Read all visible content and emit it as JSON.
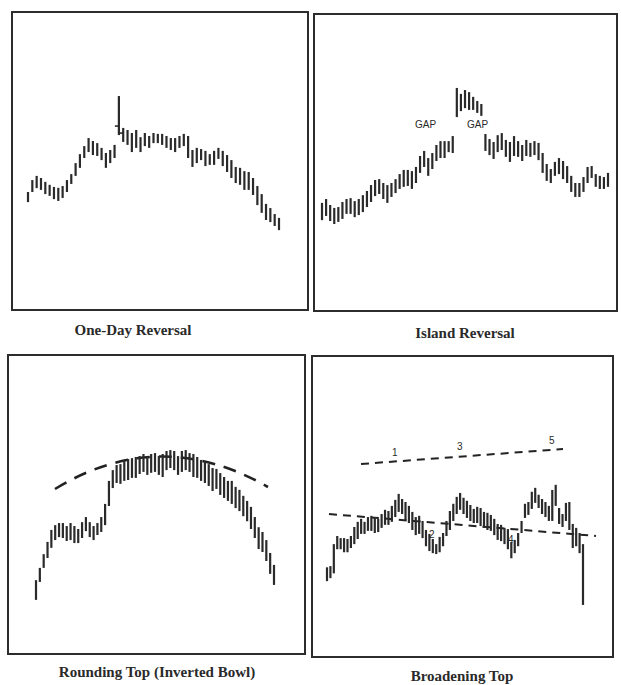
{
  "chart_data": [
    {
      "type": "bar",
      "subtype": "ohlc-range",
      "title": "One-Day Reversal",
      "xlabel": "",
      "ylabel": "",
      "ylim": [
        0,
        100
      ],
      "grid": false,
      "bars": [
        [
          39.6,
          36.2
        ],
        [
          43.6,
          39.6
        ],
        [
          45,
          40.9
        ],
        [
          44.3,
          40.3
        ],
        [
          43,
          38.9
        ],
        [
          42,
          38.3
        ],
        [
          41.3,
          37.2
        ],
        [
          41,
          36.6
        ],
        [
          41.6,
          37.6
        ],
        [
          43.6,
          39.6
        ],
        [
          45.6,
          42.3
        ],
        [
          49.3,
          45
        ],
        [
          52.3,
          47.7
        ],
        [
          55,
          51
        ],
        [
          57.7,
          53
        ],
        [
          56.7,
          52
        ],
        [
          56,
          51.7
        ],
        [
          54.4,
          50.3
        ],
        [
          52.7,
          47.7
        ],
        [
          53.7,
          49.3
        ],
        [
          55.4,
          51
        ],
        [
          71.8,
          58.7
        ],
        [
          61.1,
          56.4
        ],
        [
          60.4,
          55.4
        ],
        [
          59.4,
          53
        ],
        [
          60.4,
          54.4
        ],
        [
          58,
          53
        ],
        [
          59.4,
          55
        ],
        [
          58.4,
          54.4
        ],
        [
          59.4,
          56
        ],
        [
          59.1,
          56
        ],
        [
          59.1,
          55.4
        ],
        [
          58.4,
          54.4
        ],
        [
          57.7,
          53.7
        ],
        [
          57.7,
          53
        ],
        [
          58.4,
          54.4
        ],
        [
          59.1,
          55
        ],
        [
          58.4,
          51
        ],
        [
          53.7,
          48
        ],
        [
          54.4,
          49.3
        ],
        [
          54,
          50.3
        ],
        [
          53.4,
          48.3
        ],
        [
          52.3,
          48.7
        ],
        [
          53.4,
          48.7
        ],
        [
          54.4,
          50.7
        ],
        [
          53.4,
          48.3
        ],
        [
          52,
          46.3
        ],
        [
          50.3,
          44.3
        ],
        [
          48,
          42.6
        ],
        [
          47.7,
          42
        ],
        [
          46.6,
          40.3
        ],
        [
          46.3,
          40.3
        ],
        [
          44.3,
          38.6
        ],
        [
          41.6,
          35.2
        ],
        [
          38.9,
          32.6
        ],
        [
          35.6,
          30.2
        ],
        [
          34.2,
          29.5
        ],
        [
          32.2,
          28.2
        ],
        [
          30.9,
          26.8
        ]
      ],
      "reversal_bar_index": 21,
      "annotations": []
    },
    {
      "type": "bar",
      "subtype": "ohlc-range",
      "title": "Island Reversal",
      "xlabel": "",
      "ylabel": "",
      "ylim": [
        0,
        100
      ],
      "grid": false,
      "bars": [
        [
          36.4,
          30.6
        ],
        [
          37.7,
          32
        ],
        [
          35.7,
          30.3
        ],
        [
          34.7,
          29.3
        ],
        [
          35,
          30
        ],
        [
          36.7,
          31
        ],
        [
          37.7,
          32.7
        ],
        [
          38,
          32.7
        ],
        [
          37,
          31.6
        ],
        [
          37.7,
          32.3
        ],
        [
          39,
          33.3
        ],
        [
          40.4,
          35
        ],
        [
          42.4,
          36.7
        ],
        [
          44.1,
          38.7
        ],
        [
          44.4,
          39.4
        ],
        [
          43.1,
          37.7
        ],
        [
          42.4,
          36.4
        ],
        [
          43.1,
          38.4
        ],
        [
          44.4,
          39.7
        ],
        [
          46.1,
          41.1
        ],
        [
          47.5,
          41.8
        ],
        [
          47.5,
          42.1
        ],
        [
          47.1,
          41.1
        ],
        [
          48.5,
          43.1
        ],
        [
          52.2,
          46.5
        ],
        [
          53.9,
          48.5
        ],
        [
          51.5,
          45.5
        ],
        [
          53.2,
          47.8
        ],
        [
          55.9,
          50.5
        ],
        [
          57.2,
          51.5
        ],
        [
          57.2,
          51.5
        ],
        [
          57.2,
          53.5
        ],
        [
          58.9,
          53.2
        ],
        [
          75.1,
          65.3
        ],
        [
          73.1,
          67.3
        ],
        [
          74.4,
          68.3
        ],
        [
          73.7,
          67.7
        ],
        [
          72.1,
          67.7
        ],
        [
          70.7,
          66.7
        ],
        [
          69.7,
          65.7
        ],
        [
          59.6,
          53.9
        ],
        [
          57.9,
          52.5
        ],
        [
          56.9,
          51.2
        ],
        [
          59.2,
          53.5
        ],
        [
          59.9,
          54.2
        ],
        [
          57.6,
          51.9
        ],
        [
          56.9,
          50.2
        ],
        [
          58.9,
          52.2
        ],
        [
          57.2,
          51.9
        ],
        [
          55.9,
          50.5
        ],
        [
          57.6,
          52.2
        ],
        [
          56.6,
          51.9
        ],
        [
          57.2,
          52.5
        ],
        [
          56.6,
          50.8
        ],
        [
          53.2,
          46.5
        ],
        [
          49.5,
          43.8
        ],
        [
          47.8,
          43.1
        ],
        [
          50.2,
          45.5
        ],
        [
          51.5,
          46.1
        ],
        [
          50.5,
          44.4
        ],
        [
          48.8,
          43.1
        ],
        [
          45.5,
          40.1
        ],
        [
          43.1,
          38.4
        ],
        [
          43.1,
          38.4
        ],
        [
          45.1,
          40.1
        ],
        [
          48.5,
          43.1
        ],
        [
          48.8,
          44.8
        ],
        [
          46.1,
          41.8
        ],
        [
          45.5,
          41.1
        ],
        [
          45.1,
          41.1
        ],
        [
          46.5,
          41.8
        ]
      ],
      "gap_after_bar_indices": [
        32,
        39
      ],
      "annotations": [
        {
          "text": "GAP",
          "position": "left of island"
        },
        {
          "text": "GAP",
          "position": "right of island"
        }
      ]
    },
    {
      "type": "bar",
      "subtype": "ohlc-range",
      "title": "Rounding Top (Inverted Bowl)",
      "xlabel": "",
      "ylabel": "",
      "ylim": [
        0,
        100
      ],
      "grid": false,
      "bars": [
        [
          24.7,
          18.1
        ],
        [
          28.8,
          24.1
        ],
        [
          33.4,
          28.8
        ],
        [
          37.5,
          32.1
        ],
        [
          41.5,
          35.5
        ],
        [
          43.1,
          38.1
        ],
        [
          43.8,
          39.1
        ],
        [
          43.8,
          38.8
        ],
        [
          42.8,
          37.8
        ],
        [
          43.8,
          38.1
        ],
        [
          42.8,
          37.1
        ],
        [
          41.8,
          37.1
        ],
        [
          44.1,
          38.8
        ],
        [
          45.8,
          41.1
        ],
        [
          44.1,
          39.1
        ],
        [
          42.8,
          38.1
        ],
        [
          43.8,
          39.8
        ],
        [
          45.8,
          40.8
        ],
        [
          50.2,
          43.1
        ],
        [
          57.9,
          49.5
        ],
        [
          61.5,
          55.5
        ],
        [
          63.2,
          57.2
        ],
        [
          63.5,
          56.9
        ],
        [
          64.5,
          57.9
        ],
        [
          65.2,
          58.2
        ],
        [
          65.5,
          58.9
        ],
        [
          65.9,
          58.9
        ],
        [
          66.2,
          60.2
        ],
        [
          66.9,
          60.9
        ],
        [
          66.2,
          59.9
        ],
        [
          66.9,
          60.6
        ],
        [
          67.2,
          60.9
        ],
        [
          66.2,
          59.9
        ],
        [
          66.9,
          59.2
        ],
        [
          67.9,
          61.5
        ],
        [
          68.2,
          62.2
        ],
        [
          67.9,
          61.5
        ],
        [
          66.2,
          59.9
        ],
        [
          67.9,
          60.9
        ],
        [
          68.2,
          61.5
        ],
        [
          67.2,
          60.9
        ],
        [
          66.9,
          59.2
        ],
        [
          65.9,
          58.9
        ],
        [
          64.9,
          57.9
        ],
        [
          64.2,
          57.2
        ],
        [
          63.5,
          56.2
        ],
        [
          62.2,
          54.5
        ],
        [
          61.9,
          55.2
        ],
        [
          60.5,
          53.2
        ],
        [
          59.2,
          52.2
        ],
        [
          57.9,
          51.2
        ],
        [
          57.9,
          50.2
        ],
        [
          55.9,
          48.8
        ],
        [
          54.9,
          47.8
        ],
        [
          52.9,
          46.1
        ],
        [
          51.2,
          44.4
        ],
        [
          49.2,
          41.8
        ],
        [
          45.8,
          38.8
        ],
        [
          42.4,
          35.1
        ],
        [
          40.8,
          34.1
        ],
        [
          38.1,
          31.1
        ],
        [
          33.8,
          26.8
        ],
        [
          29.8,
          23.1
        ]
      ],
      "trendline": {
        "style": "dashed",
        "shape": "inverted arc above price"
      },
      "annotations": []
    },
    {
      "type": "bar",
      "subtype": "ohlc-range",
      "title": "Broadening Top",
      "xlabel": "",
      "ylabel": "",
      "ylim": [
        0,
        100
      ],
      "grid": false,
      "bars": [
        [
          29.8,
          25.2
        ],
        [
          30.2,
          26.2
        ],
        [
          37.5,
          27.8
        ],
        [
          40.2,
          35.8
        ],
        [
          39.5,
          35.8
        ],
        [
          39.5,
          34.8
        ],
        [
          39.2,
          34.8
        ],
        [
          40.2,
          36.2
        ],
        [
          43.2,
          37.5
        ],
        [
          44.9,
          39.2
        ],
        [
          45.9,
          40.9
        ],
        [
          44.9,
          40.9
        ],
        [
          46.5,
          41.9
        ],
        [
          46.9,
          41.9
        ],
        [
          46.5,
          41.2
        ],
        [
          45.9,
          41.5
        ],
        [
          47.5,
          42.9
        ],
        [
          48.9,
          43.9
        ],
        [
          48.5,
          43.9
        ],
        [
          50.2,
          44.9
        ],
        [
          52.2,
          46.5
        ],
        [
          54.2,
          48.2
        ],
        [
          52.5,
          47.5
        ],
        [
          51.5,
          45.5
        ],
        [
          50.2,
          44.5
        ],
        [
          48.2,
          42.2
        ],
        [
          46.5,
          40.5
        ],
        [
          46.9,
          40.9
        ],
        [
          45.2,
          39.5
        ],
        [
          42.2,
          36.8
        ],
        [
          40.9,
          35.2
        ],
        [
          39.2,
          34.5
        ],
        [
          37.5,
          34.2
        ],
        [
          39.9,
          34.8
        ],
        [
          41.2,
          36.8
        ],
        [
          45.2,
          40.2
        ],
        [
          48.5,
          42.2
        ],
        [
          50.9,
          45.2
        ],
        [
          53.2,
          47.5
        ],
        [
          54.5,
          48.9
        ],
        [
          52.9,
          47.5
        ],
        [
          51.9,
          46.2
        ],
        [
          50.5,
          45.2
        ],
        [
          49.2,
          44.5
        ],
        [
          49.9,
          44.5
        ],
        [
          49.5,
          43.5
        ],
        [
          48.2,
          42.9
        ],
        [
          47.9,
          42.2
        ],
        [
          47.2,
          41.9
        ],
        [
          45.9,
          40.5
        ],
        [
          44.2,
          38.9
        ],
        [
          43.9,
          38.5
        ],
        [
          42.9,
          37.5
        ],
        [
          42.5,
          35.8
        ],
        [
          38.2,
          32.8
        ],
        [
          38.9,
          34.5
        ],
        [
          41.2,
          36.8
        ],
        [
          45.2,
          41.2
        ],
        [
          50.9,
          46.2
        ],
        [
          51.5,
          47.2
        ],
        [
          54.9,
          49.2
        ],
        [
          56.2,
          51.2
        ],
        [
          53.9,
          49.5
        ],
        [
          52.5,
          47.5
        ],
        [
          51.5,
          46.5
        ],
        [
          50.2,
          45.2
        ],
        [
          55.5,
          45.2
        ],
        [
          57.2,
          50.2
        ],
        [
          49.5,
          44.2
        ],
        [
          47.5,
          43.2
        ],
        [
          51.2,
          45.2
        ],
        [
          51.5,
          42.2
        ],
        [
          44.2,
          36.2
        ],
        [
          42.9,
          36.8
        ],
        [
          41.2,
          34.5
        ],
        [
          37.5,
          17.3
        ]
      ],
      "upper_trendline": {
        "style": "dashed",
        "slope": "rising"
      },
      "lower_trendline": {
        "style": "dashed",
        "slope": "falling"
      },
      "annotations": [
        {
          "text": "1",
          "position": "peak"
        },
        {
          "text": "2",
          "position": "trough"
        },
        {
          "text": "3",
          "position": "peak"
        },
        {
          "text": "4",
          "position": "trough"
        },
        {
          "text": "5",
          "position": "peak"
        }
      ]
    }
  ]
}
